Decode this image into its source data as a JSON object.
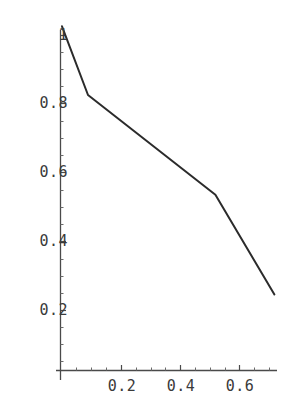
{
  "figure": {
    "background_color": "#ffffff",
    "line_color": "#2b2b2b",
    "axis_color": "#4a4a4a",
    "tick_label_color": "#3a3a3a",
    "width": 288,
    "height": 412
  },
  "axes": {
    "x": {
      "label": "",
      "tick_labels": [
        "0.2",
        "0.4",
        "0.6"
      ],
      "tick_values": [
        0.2,
        0.4,
        0.6
      ],
      "minor_ticks": true,
      "range": [
        0.0,
        0.735
      ],
      "origin_px": 62,
      "pixels_per_unit": 295.0,
      "baseline_px": 370
    },
    "y": {
      "label": "",
      "tick_labels": [
        "0.2",
        "0.4",
        "0.6",
        "0.8",
        "1"
      ],
      "tick_values": [
        0.2,
        0.4,
        0.6,
        0.8,
        1.0
      ],
      "minor_ticks": true,
      "range": [
        0.0,
        1.04
      ],
      "origin_px": 370,
      "pixels_per_unit": 343.75,
      "axis_x_px": 60
    }
  },
  "chart_data": {
    "type": "line",
    "title": "",
    "xlabel": "",
    "ylabel": "",
    "xlim": [
      0.0,
      0.735
    ],
    "ylim": [
      0.0,
      1.04
    ],
    "grid": false,
    "legend": null,
    "series": [
      {
        "name": "curve",
        "color": "#2b2b2b",
        "line_width": 2.0,
        "x": [
          0.0,
          0.088,
          0.52,
          0.72
        ],
        "y": [
          1.0,
          0.8,
          0.51,
          0.22
        ],
        "points": [
          [
            0.0,
            1.0
          ],
          [
            0.088,
            0.8
          ],
          [
            0.52,
            0.51
          ],
          [
            0.72,
            0.22
          ]
        ]
      }
    ]
  },
  "rendered": {
    "polyline_px": "61,37 86,102 213,205 272,301",
    "x_axis_px": {
      "x1": 56,
      "y1": 370,
      "x2": 277,
      "y2": 370
    },
    "y_axis_px": {
      "x1": 60,
      "y1": 30,
      "x2": 60,
      "y2": 380
    },
    "y_ticks_px": [
      {
        "value": "1",
        "y": 35
      },
      {
        "value": "0.8",
        "y": 103
      },
      {
        "value": "0.6",
        "y": 172
      },
      {
        "value": "0.4",
        "y": 241
      },
      {
        "value": "0.2",
        "y": 310
      }
    ],
    "x_ticks_px": [
      {
        "value": "0.2",
        "x": 122
      },
      {
        "value": "0.4",
        "x": 181
      },
      {
        "value": "0.6",
        "x": 240
      }
    ]
  }
}
